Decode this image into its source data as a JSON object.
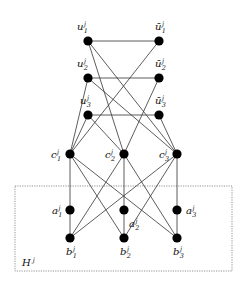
{
  "diagram": {
    "type": "graph",
    "subgraph_box": {
      "label": "H",
      "label_sup": "j",
      "x": 15,
      "y": 186,
      "w": 217,
      "h": 85
    },
    "nodes": [
      {
        "id": "u1",
        "base": "u",
        "sub": "1",
        "sup": "j",
        "x": 88,
        "y": 41,
        "lx": 81,
        "ly": 30,
        "anchor": "middle"
      },
      {
        "id": "ub1",
        "base": "ū",
        "sub": "1",
        "sup": "j",
        "x": 159,
        "y": 41,
        "lx": 159,
        "ly": 30,
        "anchor": "middle"
      },
      {
        "id": "u2",
        "base": "u",
        "sub": "2",
        "sup": "j",
        "x": 88,
        "y": 78,
        "lx": 81,
        "ly": 67,
        "anchor": "middle"
      },
      {
        "id": "ub2",
        "base": "ū",
        "sub": "2",
        "sup": "j",
        "x": 159,
        "y": 78,
        "lx": 159,
        "ly": 67,
        "anchor": "middle"
      },
      {
        "id": "u3",
        "base": "u",
        "sub": "3",
        "sup": "j",
        "x": 88,
        "y": 115,
        "lx": 84,
        "ly": 104,
        "anchor": "middle"
      },
      {
        "id": "ub3",
        "base": "ū",
        "sub": "3",
        "sup": "j",
        "x": 159,
        "y": 115,
        "lx": 159,
        "ly": 104,
        "anchor": "middle"
      },
      {
        "id": "c1",
        "base": "c",
        "sub": "1",
        "sup": "j",
        "x": 70,
        "y": 154,
        "lx": 55,
        "ly": 158,
        "anchor": "middle"
      },
      {
        "id": "c2",
        "base": "c",
        "sub": "2",
        "sup": "j",
        "x": 124,
        "y": 154,
        "lx": 109,
        "ly": 158,
        "anchor": "middle"
      },
      {
        "id": "c3",
        "base": "c",
        "sub": "3",
        "sup": "j",
        "x": 177,
        "y": 154,
        "lx": 163,
        "ly": 158,
        "anchor": "middle"
      },
      {
        "id": "a1",
        "base": "a",
        "sub": "1",
        "sup": "j",
        "x": 70,
        "y": 210,
        "lx": 56,
        "ly": 214,
        "anchor": "middle"
      },
      {
        "id": "a2",
        "base": "a",
        "sub": "2",
        "sup": "j",
        "x": 124,
        "y": 210,
        "lx": 133,
        "ly": 227,
        "anchor": "middle"
      },
      {
        "id": "a3",
        "base": "a",
        "sub": "3",
        "sup": "j",
        "x": 177,
        "y": 210,
        "lx": 190,
        "ly": 214,
        "anchor": "middle"
      },
      {
        "id": "b1",
        "base": "b",
        "sub": "1",
        "sup": "j",
        "x": 70,
        "y": 238,
        "lx": 70,
        "ly": 255,
        "anchor": "middle"
      },
      {
        "id": "b2",
        "base": "b",
        "sub": "2",
        "sup": "j",
        "x": 124,
        "y": 238,
        "lx": 124,
        "ly": 255,
        "anchor": "middle"
      },
      {
        "id": "b3",
        "base": "b",
        "sub": "3",
        "sup": "j",
        "x": 177,
        "y": 238,
        "lx": 177,
        "ly": 255,
        "anchor": "middle"
      }
    ],
    "edges": [
      [
        "u1",
        "ub1"
      ],
      [
        "u2",
        "ub2"
      ],
      [
        "u3",
        "ub3"
      ],
      [
        "u1",
        "c2"
      ],
      [
        "u1",
        "c3"
      ],
      [
        "ub1",
        "c1"
      ],
      [
        "u2",
        "c1"
      ],
      [
        "u2",
        "c3"
      ],
      [
        "ub2",
        "c2"
      ],
      [
        "u3",
        "c1"
      ],
      [
        "u3",
        "c2"
      ],
      [
        "ub3",
        "c3"
      ],
      [
        "c1",
        "a1"
      ],
      [
        "a1",
        "b1"
      ],
      [
        "c2",
        "a2"
      ],
      [
        "a2",
        "b2"
      ],
      [
        "c3",
        "a3"
      ],
      [
        "a3",
        "b3"
      ],
      [
        "c1",
        "b2"
      ],
      [
        "c1",
        "b3"
      ],
      [
        "c2",
        "b1"
      ],
      [
        "c2",
        "b3"
      ],
      [
        "c3",
        "b1"
      ],
      [
        "c3",
        "b2"
      ]
    ],
    "node_radius": 4.6
  }
}
